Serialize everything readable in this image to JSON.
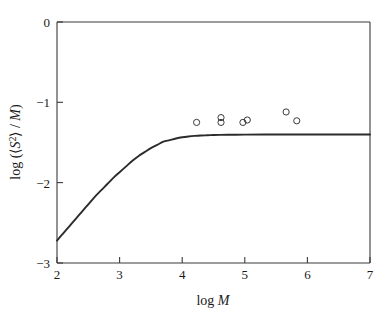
{
  "chart_data": {
    "type": "line",
    "title": "",
    "subtitle": "",
    "xlabel": "log M",
    "ylabel": "log (⟨S²⟩ / M)",
    "xlim": [
      2,
      7
    ],
    "ylim": [
      -3,
      0
    ],
    "xticks": [
      2,
      3,
      4,
      5,
      6,
      7
    ],
    "xtick_labels": [
      "2",
      "3",
      "4",
      "5",
      "6",
      "7"
    ],
    "yticks": [
      0,
      -1,
      -2,
      -3
    ],
    "ytick_labels": [
      "0",
      "−1",
      "−2",
      "−3"
    ],
    "grid": false,
    "legend": null,
    "series": [
      {
        "name": "theoretical curve",
        "type": "line",
        "style": "solid",
        "color": "#2b2b2b",
        "x": [
          2.0,
          2.1,
          2.2,
          2.3,
          2.4,
          2.5,
          2.6,
          2.7,
          2.8,
          2.9,
          3.0,
          3.1,
          3.2,
          3.3,
          3.4,
          3.5,
          3.6,
          3.7,
          3.8,
          3.9,
          4.0,
          4.1,
          4.2,
          4.3,
          4.4,
          4.5,
          4.6,
          4.8,
          5.0,
          5.5,
          6.0,
          6.5,
          7.0
        ],
        "y": [
          -2.72,
          -2.63,
          -2.54,
          -2.45,
          -2.36,
          -2.27,
          -2.18,
          -2.1,
          -2.02,
          -1.94,
          -1.87,
          -1.8,
          -1.73,
          -1.67,
          -1.62,
          -1.57,
          -1.53,
          -1.49,
          -1.47,
          -1.45,
          -1.435,
          -1.425,
          -1.418,
          -1.413,
          -1.41,
          -1.407,
          -1.405,
          -1.403,
          -1.402,
          -1.401,
          -1.4,
          -1.4,
          -1.4
        ]
      },
      {
        "name": "experimental data",
        "type": "scatter",
        "marker": "open-circle",
        "color": "#3a3a3a",
        "x": [
          4.23,
          4.62,
          4.62,
          4.97,
          5.04,
          5.66,
          5.83
        ],
        "y": [
          -1.25,
          -1.19,
          -1.25,
          -1.25,
          -1.22,
          -1.12,
          -1.23
        ]
      }
    ],
    "annotations": []
  },
  "axes": {
    "x_title_prefix": "log ",
    "x_title_italic": "M",
    "y_title_text": "log (⟨S²⟩ / M)"
  }
}
